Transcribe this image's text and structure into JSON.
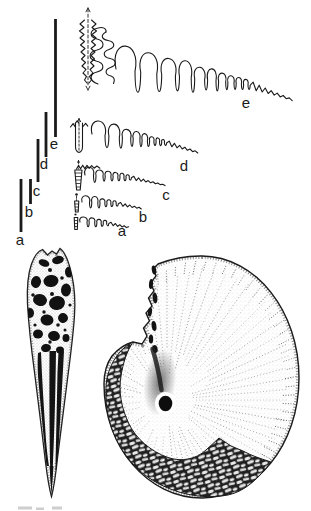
{
  "figure": {
    "background_color": "#ffffff",
    "ink_color": "#1a1a1a",
    "sutures": {
      "labels": [
        "a",
        "b",
        "c",
        "d",
        "e"
      ]
    },
    "scale_bars": {
      "labels": [
        "a",
        "b",
        "c",
        "d",
        "e"
      ]
    }
  }
}
